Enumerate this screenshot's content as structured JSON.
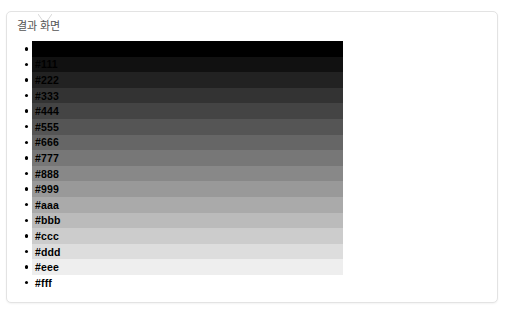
{
  "card": {
    "title": "결과 화면",
    "notch_icon": "caret-down-notch-icon",
    "border_color": "#e3e3e3",
    "background_color": "#ffffff"
  },
  "swatch_list": {
    "bullet_color": "#000000",
    "label_color": "#000000",
    "items": [
      {
        "label": "#000",
        "color": "#000000"
      },
      {
        "label": "#111",
        "color": "#111111"
      },
      {
        "label": "#222",
        "color": "#222222"
      },
      {
        "label": "#333",
        "color": "#333333"
      },
      {
        "label": "#444",
        "color": "#444444"
      },
      {
        "label": "#555",
        "color": "#555555"
      },
      {
        "label": "#666",
        "color": "#666666"
      },
      {
        "label": "#777",
        "color": "#777777"
      },
      {
        "label": "#888",
        "color": "#888888"
      },
      {
        "label": "#999",
        "color": "#999999"
      },
      {
        "label": "#aaa",
        "color": "#aaaaaa"
      },
      {
        "label": "#bbb",
        "color": "#bbbbbb"
      },
      {
        "label": "#ccc",
        "color": "#cccccc"
      },
      {
        "label": "#ddd",
        "color": "#dddddd"
      },
      {
        "label": "#eee",
        "color": "#eeeeee"
      },
      {
        "label": "#fff",
        "color": "#ffffff"
      }
    ]
  }
}
